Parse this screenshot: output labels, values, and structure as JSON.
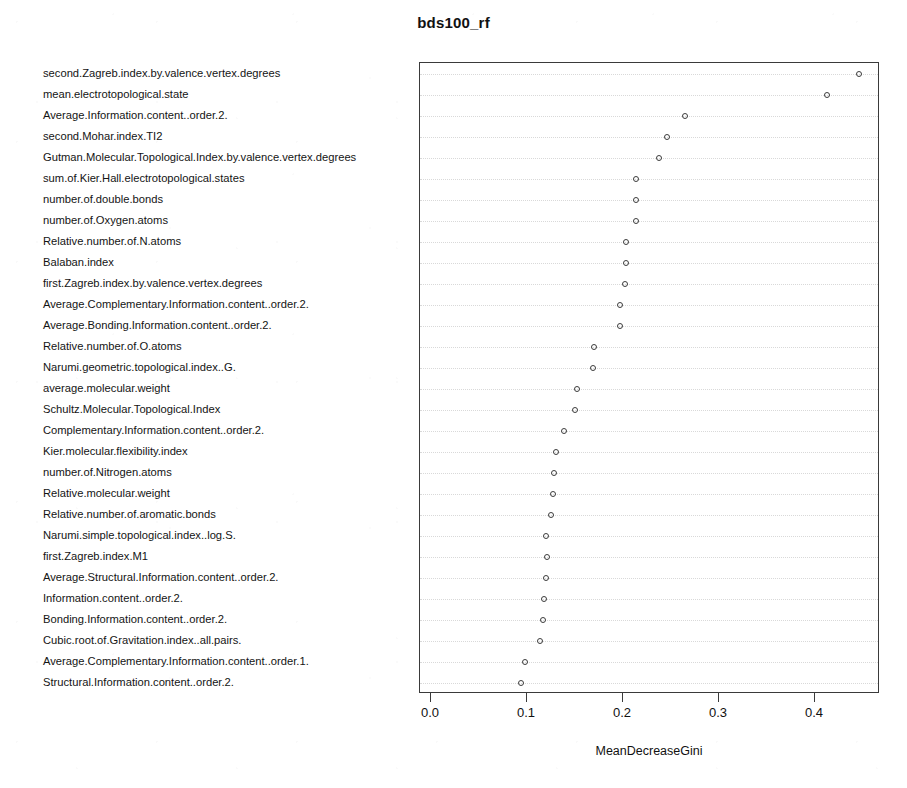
{
  "chart_data": {
    "type": "scatter",
    "title": "bds100_rf",
    "xlabel": "MeanDecreaseGini",
    "ylabel": "",
    "xlim": [
      -0.0115,
      0.4677
    ],
    "xticks": [
      0.0,
      0.1,
      0.2,
      0.3,
      0.4
    ],
    "xtick_labels": [
      "0.0",
      "0.1",
      "0.2",
      "0.3",
      "0.4"
    ],
    "grid": true,
    "grid_orientation": "horizontal",
    "legend": "none",
    "marker": "open-circle",
    "categories": [
      "second.Zagreb.index.by.valence.vertex.degrees",
      "mean.electrotopological.state",
      "Average.Information.content..order.2.",
      "second.Mohar.index.TI2",
      "Gutman.Molecular.Topological.Index.by.valence.vertex.degrees",
      "sum.of.Kier.Hall.electrotopological.states",
      "number.of.double.bonds",
      "number.of.Oxygen.atoms",
      "Relative.number.of.N.atoms",
      "Balaban.index",
      "first.Zagreb.index.by.valence.vertex.degrees",
      "Average.Complementary.Information.content..order.2.",
      "Average.Bonding.Information.content..order.2.",
      "Relative.number.of.O.atoms",
      "Narumi.geometric.topological.index..G.",
      "average.molecular.weight",
      "Schultz.Molecular.Topological.Index",
      "Complementary.Information.content..order.2.",
      "Kier.molecular.flexibility.index",
      "number.of.Nitrogen.atoms",
      "Relative.molecular.weight",
      "Relative.number.of.aromatic.bonds",
      "Narumi.simple.topological.index..log.S.",
      "first.Zagreb.index.M1",
      "Average.Structural.Information.content..order.2.",
      "Information.content..order.2.",
      "Bonding.Information.content..order.2.",
      "Cubic.root.of.Gravitation.index..all.pairs.",
      "Average.Complementary.Information.content..order.1.",
      "Structural.Information.content..order.2."
    ],
    "values": [
      0.446,
      0.412,
      0.265,
      0.246,
      0.237,
      0.214,
      0.213,
      0.213,
      0.203,
      0.203,
      0.202,
      0.197,
      0.197,
      0.17,
      0.169,
      0.152,
      0.15,
      0.139,
      0.13,
      0.128,
      0.127,
      0.125,
      0.12,
      0.121,
      0.12,
      0.118,
      0.117,
      0.113,
      0.098,
      0.094
    ]
  },
  "colors": {
    "frame": "#3a3a3a",
    "gridline": "#d9d9d9",
    "marker": "#3d3d3d",
    "text": "#111111",
    "background": "#ffffff"
  }
}
